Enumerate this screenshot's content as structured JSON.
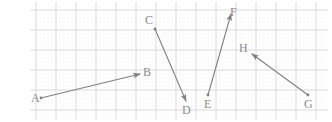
{
  "figure": {
    "name": "vector-diagram-on-graph-paper",
    "width": 332,
    "height": 122,
    "background_color": "#ffffff",
    "grid": {
      "major_color": "#d8d8d8",
      "minor_color": "#e8e8e8",
      "major_spacing": 20,
      "minor_spacing": 4,
      "origin_x": 36,
      "origin_y": 10,
      "cols": 15,
      "rows": 6,
      "x_start": 36,
      "x_end": 320,
      "y_start": 10,
      "y_end": 110
    },
    "stroke_color": "#808080",
    "label_color": "#8c8c8c",
    "stroke_width": 1.1,
    "points": [
      {
        "id": "A",
        "label": "A",
        "x": 41,
        "y": 98,
        "label_x": 31,
        "label_y": 92,
        "role": "tail"
      },
      {
        "id": "B",
        "label": "B",
        "x": 140,
        "y": 74,
        "label_x": 143,
        "label_y": 66,
        "role": "head"
      },
      {
        "id": "C",
        "label": "C",
        "x": 155,
        "y": 29,
        "label_x": 145,
        "label_y": 14,
        "role": "tail"
      },
      {
        "id": "D",
        "label": "D",
        "x": 186,
        "y": 101,
        "label_x": 182,
        "label_y": 104,
        "role": "head"
      },
      {
        "id": "E",
        "label": "E",
        "x": 208,
        "y": 95,
        "label_x": 204,
        "label_y": 98,
        "role": "tail"
      },
      {
        "id": "F",
        "label": "F",
        "x": 231,
        "y": 14,
        "label_x": 230,
        "label_y": 6,
        "role": "head"
      },
      {
        "id": "G",
        "label": "G",
        "x": 308,
        "y": 95,
        "label_x": 304,
        "label_y": 98,
        "role": "tail"
      },
      {
        "id": "H",
        "label": "H",
        "x": 252,
        "y": 54,
        "label_x": 239,
        "label_y": 42,
        "role": "head"
      }
    ],
    "vectors": [
      {
        "id": "AB",
        "name": "vector-a-to-b",
        "from": "A",
        "to": "B",
        "x1": 41,
        "y1": 98,
        "x2": 140,
        "y2": 74
      },
      {
        "id": "CD",
        "name": "vector-c-to-d",
        "from": "C",
        "to": "D",
        "x1": 155,
        "y1": 29,
        "x2": 186,
        "y2": 101
      },
      {
        "id": "EF",
        "name": "vector-e-to-f",
        "from": "E",
        "to": "F",
        "x1": 208,
        "y1": 95,
        "x2": 231,
        "y2": 14
      },
      {
        "id": "GH",
        "name": "vector-g-to-h",
        "from": "G",
        "to": "H",
        "x1": 308,
        "y1": 95,
        "x2": 252,
        "y2": 54
      }
    ]
  }
}
